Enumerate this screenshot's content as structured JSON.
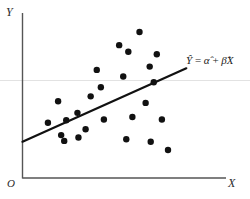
{
  "figure": {
    "background_color": "#ffffff",
    "ink_color": "#1a1a1a",
    "gridline_color": "#e2e2e2",
    "axis_color": "#555555"
  },
  "labels": {
    "y_axis": "Y",
    "x_axis": "X",
    "origin": "O",
    "equation_parts": {
      "yhat": "Y",
      "equals": "=",
      "alphahat": "α",
      "plus": "+",
      "betahat": "β",
      "x": "X"
    },
    "equation_text": "Ŷ = α̂ + β̂X"
  },
  "chart_data": {
    "type": "scatter",
    "title": "",
    "xlabel": "X",
    "ylabel": "Y",
    "grid": true,
    "legend": "none",
    "xlim": [
      0,
      100
    ],
    "ylim": [
      0,
      100
    ],
    "gridlines": {
      "horizontal": [
        59.5
      ],
      "vertical": []
    },
    "series": [
      {
        "name": "observations",
        "marker": "filled-circle",
        "marker_color": "#111111",
        "marker_size_px": 3.2,
        "points": [
          {
            "x": 12.5,
            "y": 33.5
          },
          {
            "x": 17.5,
            "y": 46.5
          },
          {
            "x": 19.0,
            "y": 26.0
          },
          {
            "x": 20.5,
            "y": 22.5
          },
          {
            "x": 21.5,
            "y": 35.0
          },
          {
            "x": 27.0,
            "y": 39.5
          },
          {
            "x": 27.5,
            "y": 24.5
          },
          {
            "x": 31.0,
            "y": 29.5
          },
          {
            "x": 33.5,
            "y": 49.5
          },
          {
            "x": 36.5,
            "y": 65.5
          },
          {
            "x": 38.5,
            "y": 55.0
          },
          {
            "x": 40.0,
            "y": 35.5
          },
          {
            "x": 47.5,
            "y": 80.5
          },
          {
            "x": 49.5,
            "y": 61.5
          },
          {
            "x": 51.0,
            "y": 23.5
          },
          {
            "x": 52.0,
            "y": 76.5
          },
          {
            "x": 54.0,
            "y": 37.0
          },
          {
            "x": 57.5,
            "y": 88.5
          },
          {
            "x": 60.5,
            "y": 45.5
          },
          {
            "x": 62.5,
            "y": 67.5
          },
          {
            "x": 63.0,
            "y": 22.0
          },
          {
            "x": 64.5,
            "y": 58.0
          },
          {
            "x": 66.0,
            "y": 75.0
          },
          {
            "x": 68.5,
            "y": 35.5
          },
          {
            "x": 71.5,
            "y": 17.0
          }
        ]
      }
    ],
    "fit_line": {
      "name": "fitted regression line",
      "label": "Ŷ = α̂ + β̂X",
      "color": "#111111",
      "width_px": 2.2,
      "start": {
        "x": 0.0,
        "y": 22.0
      },
      "end": {
        "x": 80.5,
        "y": 66.5
      }
    }
  }
}
